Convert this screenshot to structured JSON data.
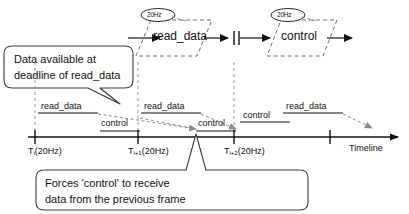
{
  "diagram": {
    "colors": {
      "stroke": "#111111",
      "dashed": "#666666",
      "background": "#ffffff",
      "callout_fill": "#ffffff"
    },
    "flow": {
      "blocks": [
        {
          "name": "read_data",
          "label": "read_data",
          "rate_tag": "20Hz"
        },
        {
          "name": "control",
          "label": "control",
          "rate_tag": "20Hz"
        }
      ],
      "separator": "double-bar"
    },
    "callouts": [
      {
        "name": "data-available-callout",
        "lines": [
          "Data available at",
          "deadline of read_data"
        ]
      },
      {
        "name": "forces-control-callout",
        "lines": [
          "Forces 'control' to receive",
          "data from the previous frame"
        ]
      }
    ],
    "timeline": {
      "axis_label": "Timeline",
      "ticks": [
        {
          "name": "tick-ti",
          "t": "T",
          "sub": "i",
          "rate": "(20Hz)"
        },
        {
          "name": "tick-ti1",
          "t": "T",
          "sub": "i+1",
          "rate": "(20Hz)"
        },
        {
          "name": "tick-ti2",
          "t": "T",
          "sub": "i+2",
          "rate": "(20Hz)"
        },
        {
          "name": "tick-ti3",
          "t": "",
          "sub": "",
          "rate": ""
        }
      ],
      "tasks": [
        {
          "name": "task-read-data-1",
          "label": "read_data"
        },
        {
          "name": "task-control-1",
          "label": "control"
        },
        {
          "name": "task-read-data-2",
          "label": "read_data"
        },
        {
          "name": "task-control-2",
          "label": "control"
        },
        {
          "name": "task-control-3",
          "label": "control"
        },
        {
          "name": "task-read-data-3",
          "label": "read_data"
        }
      ]
    }
  }
}
